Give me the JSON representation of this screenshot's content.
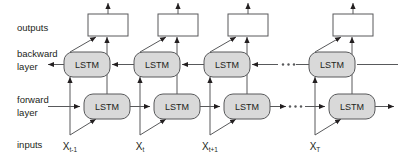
{
  "figure": {
    "type": "bidirectional-lstm-diagram",
    "background_color": "#ffffff",
    "line_color": "#58595b",
    "cell_fill_color": "#d9d9d9",
    "output_box_fill_color": "#ffffff",
    "text_color": "#231f20"
  },
  "row_labels": {
    "outputs": "outputs",
    "backward_line1": "backward",
    "backward_line2": "layer",
    "forward_line1": "forward",
    "forward_line2": "layer",
    "inputs": "inputs"
  },
  "cells": {
    "label": "LSTM",
    "backward_count": 4,
    "forward_count": 4
  },
  "columns": [
    {
      "index": 0,
      "input_base": "X",
      "input_sub": "t-1",
      "has_output_box": true
    },
    {
      "index": 1,
      "input_base": "X",
      "input_sub": "t",
      "has_output_box": true
    },
    {
      "index": 2,
      "input_base": "X",
      "input_sub": "t+1",
      "has_output_box": true
    },
    {
      "index": 3,
      "input_base": "X",
      "input_sub": "T",
      "has_output_box": true
    }
  ],
  "ellipsis": {
    "glyph": "· · ·",
    "dot_count": 3,
    "rows": [
      "backward",
      "forward"
    ]
  }
}
